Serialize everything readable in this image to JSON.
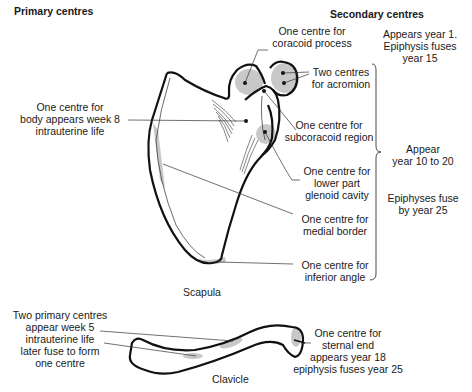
{
  "headings": {
    "primary": "Primary centres",
    "secondary": "Secondary centres"
  },
  "captions": {
    "scapula": "Scapula",
    "clavicle": "Clavicle"
  },
  "labels": {
    "body": [
      "One centre for",
      "body appears week 8",
      "intrauterine life"
    ],
    "coracoid": [
      "One centre for",
      "coracoid process"
    ],
    "coracoid_timing": [
      "Appears year 1.",
      "Epiphysis fuses",
      "year 15"
    ],
    "acromion": [
      "Two centres",
      "for acromion"
    ],
    "subcoracoid": [
      "One centre for",
      "subcoracoid region"
    ],
    "glenoid": [
      "One centre for",
      "lower part",
      "glenoid cavity"
    ],
    "medial_border": [
      "One centre for",
      "medial border"
    ],
    "inferior_angle": [
      "One centre for",
      "inferior angle"
    ],
    "group_appear": [
      "Appear",
      "year 10 to 20"
    ],
    "group_fuse": [
      "Epiphyses fuse",
      "by year 25"
    ],
    "clavicle_primary": [
      "Two primary centres",
      "appear week 5",
      "intrauterine life",
      "later fuse to form",
      "one centre"
    ],
    "sternal_end": [
      "One centre for",
      "sternal end",
      "appears year 18",
      "epiphysis fuses year 25"
    ]
  },
  "colors": {
    "outline": "#111111",
    "ossification_shade": "#c8c8c8",
    "leader_line": "#333333"
  }
}
